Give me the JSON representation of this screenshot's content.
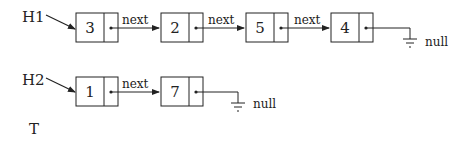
{
  "diagram": {
    "type": "linked-lists",
    "pointer_label": "next",
    "null_label": "null",
    "lists": [
      {
        "head": "H1",
        "nodes": [
          "3",
          "2",
          "5",
          "4"
        ]
      },
      {
        "head": "H2",
        "nodes": [
          "1",
          "7"
        ]
      }
    ],
    "extra_label": "T",
    "colors": {
      "stroke": "#222222",
      "background": "#ffffff"
    }
  }
}
